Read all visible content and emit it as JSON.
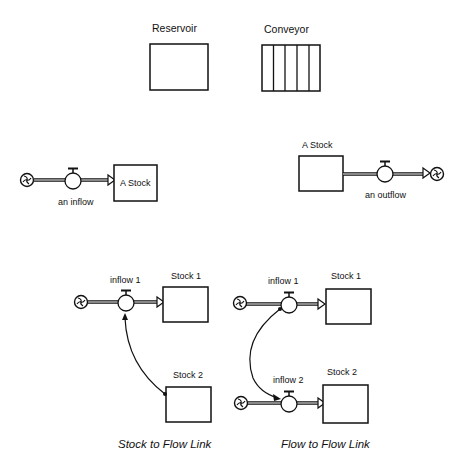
{
  "legend": {
    "reservoir_label": "Reservoir",
    "conveyor_label": "Conveyor"
  },
  "inflow_example": {
    "flow_label": "an inflow",
    "stock_label": "A Stock"
  },
  "outflow_example": {
    "stock_label": "A Stock",
    "flow_label": "an outflow"
  },
  "stock_to_flow": {
    "flow_label": "inflow 1",
    "stock1_label": "Stock 1",
    "stock2_label": "Stock 2",
    "caption": "Stock to Flow Link"
  },
  "flow_to_flow": {
    "flow1_label": "inflow 1",
    "flow2_label": "inflow 2",
    "stock1_label": "Stock 1",
    "stock2_label": "Stock 2",
    "caption": "Flow to Flow Link"
  },
  "colors": {
    "stroke": "#111111",
    "background": "#ffffff"
  }
}
